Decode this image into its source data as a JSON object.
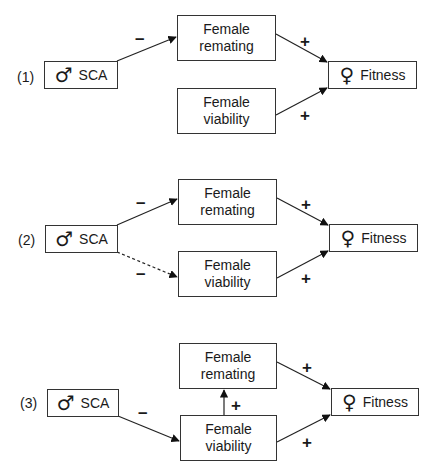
{
  "panels": [
    {
      "id": "(1)",
      "source": {
        "symbol": "♂",
        "label": "SCA"
      },
      "remating": {
        "line1": "Female",
        "line2": "remating"
      },
      "viability": {
        "line1": "Female",
        "line2": "viability"
      },
      "target": {
        "symbol": "♀",
        "label": "Fitness"
      },
      "signs": {
        "sca_to_remating": "–",
        "remating_to_fitness": "+",
        "viability_to_fitness": "+"
      }
    },
    {
      "id": "(2)",
      "source": {
        "symbol": "♂",
        "label": "SCA"
      },
      "remating": {
        "line1": "Female",
        "line2": "remating"
      },
      "viability": {
        "line1": "Female",
        "line2": "viability"
      },
      "target": {
        "symbol": "♀",
        "label": "Fitness"
      },
      "signs": {
        "sca_to_remating": "–",
        "sca_to_viability_dashed": "–",
        "remating_to_fitness": "+",
        "viability_to_fitness": "+"
      }
    },
    {
      "id": "(3)",
      "source": {
        "symbol": "♂",
        "label": "SCA"
      },
      "remating": {
        "line1": "Female",
        "line2": "remating"
      },
      "viability": {
        "line1": "Female",
        "line2": "viability"
      },
      "target": {
        "symbol": "♀",
        "label": "Fitness"
      },
      "signs": {
        "sca_to_viability": "–",
        "viability_to_remating": "+",
        "remating_to_fitness": "+",
        "viability_to_fitness": "+"
      }
    }
  ]
}
